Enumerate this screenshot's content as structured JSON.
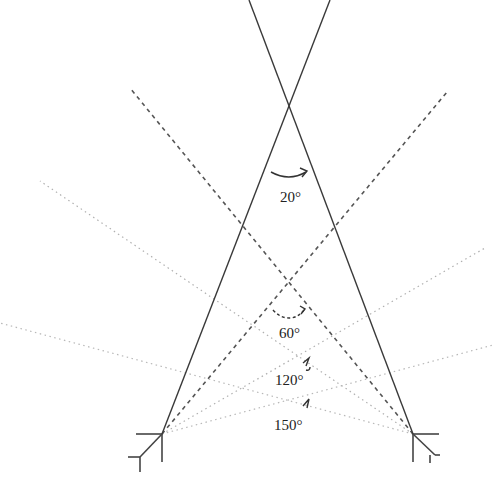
{
  "diagram": {
    "colors": {
      "solid_line": "#3a3a3a",
      "dashed_line": "#555555",
      "dotted_line": "#b0b0b0",
      "text": "#222222",
      "background": "#ffffff"
    },
    "origins": {
      "left": {
        "x": 162,
        "y": 434
      },
      "right": {
        "x": 413,
        "y": 434
      }
    },
    "angles": [
      {
        "id": "a20",
        "label": "20°",
        "style": "solid",
        "apex": {
          "x": 289,
          "y": 125
        },
        "label_pos": {
          "x": 280,
          "y": 200
        }
      },
      {
        "id": "a60",
        "label": "60°",
        "style": "dashed",
        "apex": {
          "x": 289,
          "y": 282
        },
        "label_pos": {
          "x": 279,
          "y": 337
        }
      },
      {
        "id": "a120",
        "label": "120°",
        "style": "dotted",
        "apex": {
          "x": 288,
          "y": 362
        },
        "label_pos": {
          "x": 275,
          "y": 384
        }
      },
      {
        "id": "a150",
        "label": "150°",
        "style": "dotted",
        "apex": {
          "x": 288,
          "y": 400
        },
        "label_pos": {
          "x": 274,
          "y": 430
        }
      }
    ]
  }
}
